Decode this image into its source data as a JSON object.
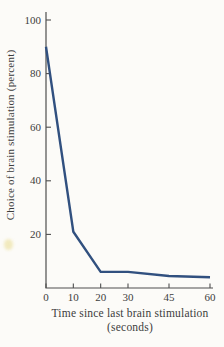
{
  "chart_data": {
    "type": "line",
    "title": "",
    "xlabel_line1": "Time since last brain stimulation",
    "xlabel_line2": "(seconds)",
    "ylabel": "Choice of brain stimulation (percent)",
    "x": [
      0,
      10,
      20,
      30,
      45,
      60
    ],
    "series": [
      {
        "name": "choice-of-brain-stimulation",
        "values": [
          90,
          21,
          6,
          6,
          4.5,
          4
        ]
      }
    ],
    "x_ticks": [
      0,
      10,
      20,
      30,
      45,
      60
    ],
    "y_ticks": [
      20,
      40,
      60,
      80,
      100
    ],
    "xlim": [
      0,
      60
    ],
    "ylim": [
      0,
      100
    ],
    "grid": false,
    "legend": false,
    "line_color": "#31507f",
    "axis_color": "#4f4f4f",
    "text_color": "#3d3d3d",
    "background": "#fcfbf8",
    "smudge_color": "#eee4ab"
  }
}
